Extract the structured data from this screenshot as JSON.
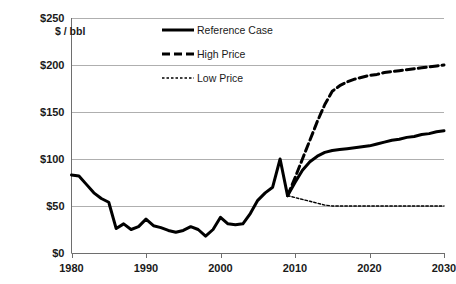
{
  "chart_data": {
    "type": "line",
    "title": "",
    "subtitle": "",
    "xlabel": "",
    "ylabel": "$ / bbl",
    "y_axis_unit_label": "$ / bbl",
    "xlim": [
      1980,
      2030
    ],
    "ylim": [
      0,
      250
    ],
    "grid": true,
    "grid_axis": "y",
    "legend_position": "top-center",
    "x_ticks": [
      1980,
      1990,
      2000,
      2010,
      2020,
      2030
    ],
    "x_tick_labels": [
      "1980",
      "1990",
      "2000",
      "2010",
      "2020",
      "2030"
    ],
    "y_ticks": [
      0,
      50,
      100,
      150,
      200,
      250
    ],
    "y_tick_labels": [
      "$0",
      "$50",
      "$100",
      "$150",
      "$200",
      "$250"
    ],
    "series": [
      {
        "name": "Reference Case",
        "style": "solid",
        "color": "#000000",
        "x": [
          1980,
          1981,
          1982,
          1983,
          1984,
          1985,
          1986,
          1987,
          1988,
          1989,
          1990,
          1991,
          1992,
          1993,
          1994,
          1995,
          1996,
          1997,
          1998,
          1999,
          2000,
          2001,
          2002,
          2003,
          2004,
          2005,
          2006,
          2007,
          2008,
          2009,
          2010,
          2011,
          2012,
          2013,
          2014,
          2015,
          2016,
          2017,
          2018,
          2019,
          2020,
          2021,
          2022,
          2023,
          2024,
          2025,
          2026,
          2027,
          2028,
          2029,
          2030
        ],
        "y": [
          83,
          82,
          73,
          64,
          58,
          54,
          26,
          31,
          25,
          28,
          36,
          29,
          27,
          24,
          22,
          24,
          28,
          25,
          18,
          25,
          38,
          31,
          30,
          31,
          42,
          56,
          64,
          70,
          100,
          61,
          75,
          88,
          97,
          103,
          107,
          109,
          110,
          111,
          112,
          113,
          114,
          116,
          118,
          120,
          121,
          123,
          124,
          126,
          127,
          129,
          130
        ]
      },
      {
        "name": "High Price",
        "style": "dashed-long",
        "color": "#000000",
        "x": [
          2009,
          2010,
          2011,
          2012,
          2013,
          2014,
          2015,
          2016,
          2017,
          2018,
          2019,
          2020,
          2021,
          2022,
          2023,
          2024,
          2025,
          2026,
          2027,
          2028,
          2029,
          2030
        ],
        "y": [
          61,
          80,
          100,
          120,
          140,
          158,
          172,
          178,
          182,
          185,
          187,
          189,
          190,
          192,
          193,
          194,
          195,
          196,
          197,
          198,
          199,
          200
        ]
      },
      {
        "name": "Low Price",
        "style": "dashed-short",
        "color": "#000000",
        "x": [
          2009,
          2010,
          2011,
          2012,
          2013,
          2014,
          2015,
          2016,
          2017,
          2018,
          2019,
          2020,
          2021,
          2022,
          2023,
          2024,
          2025,
          2026,
          2027,
          2028,
          2029,
          2030
        ],
        "y": [
          61,
          59,
          57,
          55,
          53,
          51,
          50,
          50,
          50,
          50,
          50,
          50,
          50,
          50,
          50,
          50,
          50,
          50,
          50,
          50,
          50,
          50
        ]
      }
    ],
    "legend_entries": [
      {
        "label": "Reference Case",
        "style": "solid"
      },
      {
        "label": "High Price",
        "style": "dashed-long"
      },
      {
        "label": "Low Price",
        "style": "dashed-short"
      }
    ]
  }
}
